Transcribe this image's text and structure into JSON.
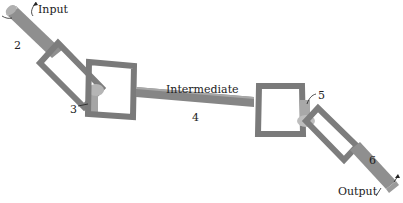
{
  "diagram": {
    "labels": {
      "input": "Input",
      "output": "Output",
      "intermediate": "Intermediate",
      "part2": "2",
      "part3": "3",
      "part4": "4",
      "part5": "5",
      "part6": "6"
    },
    "colors": {
      "shaft": "#8a8a8a",
      "shaft_light": "#b8b8b8",
      "yoke": "#7d7d7d",
      "text": "#222222",
      "background": "#ffffff"
    }
  }
}
